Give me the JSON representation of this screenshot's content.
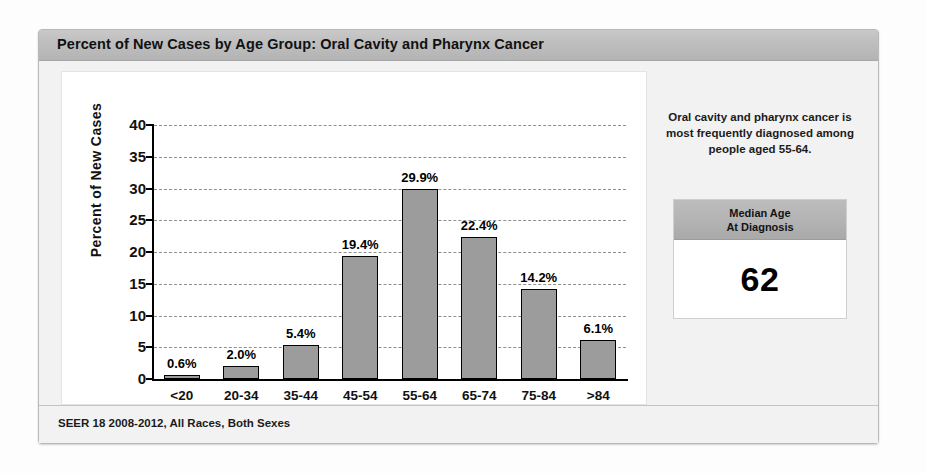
{
  "card": {
    "title": "Percent of New Cases by Age Group: Oral Cavity and Pharynx Cancer",
    "footer": "SEER 18 2008-2012, All Races, Both Sexes"
  },
  "side": {
    "note": "Oral cavity and pharynx cancer is most frequently diagnosed among people aged 55-64.",
    "median_label_line1": "Median Age",
    "median_label_line2": "At Diagnosis",
    "median_value": "62"
  },
  "chart_data": {
    "type": "bar",
    "title": "Percent of New Cases by Age Group: Oral Cavity and Pharynx Cancer",
    "xlabel": "Age",
    "ylabel": "Percent of New Cases",
    "ylim": [
      0,
      40
    ],
    "yticks": [
      0,
      5,
      10,
      15,
      20,
      25,
      30,
      35,
      40
    ],
    "ytick_labels": [
      "0",
      "5",
      "10",
      "15",
      "20",
      "25",
      "30",
      "35",
      "40"
    ],
    "grid": "horizontal-dashed",
    "legend": "none",
    "bar_color": "#9c9c9c",
    "bar_edge_color": "#000000",
    "categories": [
      "<20",
      "20-34",
      "35-44",
      "45-54",
      "55-64",
      "65-74",
      "75-84",
      ">84"
    ],
    "values": [
      0.6,
      2.0,
      5.4,
      19.4,
      29.9,
      22.4,
      14.2,
      6.1
    ],
    "data_labels": [
      "0.6%",
      "2.0%",
      "5.4%",
      "19.4%",
      "29.9%",
      "22.4%",
      "14.2%",
      "6.1%"
    ]
  }
}
